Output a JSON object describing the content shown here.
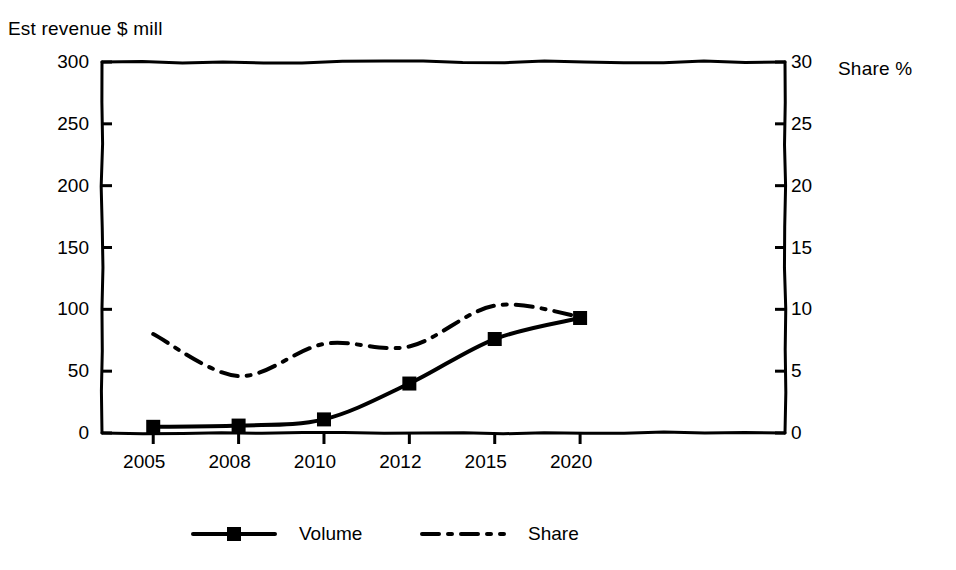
{
  "chart_data": {
    "type": "line",
    "title": "",
    "ylabel": "Est revenue $ mill",
    "y2label": "Share %",
    "xlabel": "",
    "categories": [
      "2005",
      "2008",
      "2010",
      "2012",
      "2015",
      "2020"
    ],
    "x_tick_labels": [
      "2005",
      "2008",
      "2010",
      "2012",
      "2015",
      "2020"
    ],
    "y_tick_labels": [
      "0",
      "50",
      "100",
      "150",
      "200",
      "250",
      "300"
    ],
    "y_ticks": [
      0,
      50,
      100,
      150,
      200,
      250,
      300
    ],
    "ylim": [
      0,
      300
    ],
    "y2_tick_labels": [
      "0",
      "5",
      "10",
      "15",
      "20",
      "25",
      "30"
    ],
    "y2_ticks": [
      0,
      5,
      10,
      15,
      20,
      25,
      30
    ],
    "y2lim": [
      0,
      30
    ],
    "grid": false,
    "legend_position": "bottom-center",
    "series": [
      {
        "name": "Volume",
        "axis": "left",
        "style": "solid-with-square-markers",
        "color": "#000000",
        "values": [
          5,
          6,
          11,
          40,
          76,
          93
        ]
      },
      {
        "name": "Share",
        "axis": "right",
        "style": "dash-dot",
        "color": "#000000",
        "values": [
          8.0,
          4.6,
          7.2,
          7.0,
          10.3,
          9.4
        ]
      }
    ],
    "legend_entries": [
      "Volume",
      "Share"
    ]
  }
}
